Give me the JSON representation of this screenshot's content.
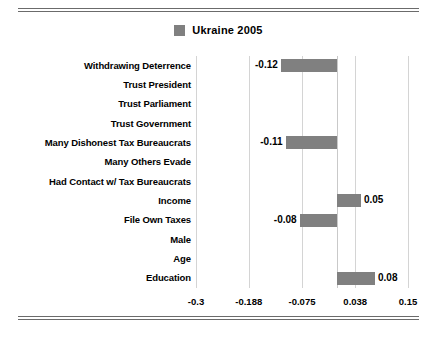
{
  "legend": {
    "swatch_color": "#808080",
    "label": "Ukraine 2005"
  },
  "axis": {
    "ticks": [
      "-0.3",
      "-0.188",
      "-0.075",
      "0.038",
      "0.15"
    ]
  },
  "chart_data": {
    "type": "bar",
    "orientation": "horizontal",
    "title": "",
    "subtitle": "",
    "xlabel": "",
    "ylabel": "",
    "xlim": [
      -0.3,
      0.15
    ],
    "xticks": [
      -0.3,
      -0.188,
      -0.075,
      0.038,
      0.15
    ],
    "xtick_labels": [
      "-0.3",
      "-0.188",
      "-0.075",
      "0.038",
      "0.15"
    ],
    "grid": true,
    "legend_position": "top-center",
    "bar_color": "#808080",
    "series": [
      {
        "name": "Ukraine 2005",
        "categories": [
          "Withdrawing Deterrence",
          "Trust President",
          "Trust Parliament",
          "Trust Government",
          "Many Dishonest Tax Bureaucrats",
          "Many Others Evade",
          "Had Contact w/ Tax Bureaucrats",
          "Income",
          "File Own Taxes",
          "Male",
          "Age",
          "Education"
        ],
        "values": [
          -0.12,
          null,
          null,
          null,
          -0.11,
          null,
          null,
          0.05,
          -0.08,
          null,
          null,
          0.08
        ],
        "value_labels": [
          "-0.12",
          "",
          "",
          "",
          "-0.11",
          "",
          "",
          "0.05",
          "-0.08",
          "",
          "",
          "0.08"
        ]
      }
    ]
  },
  "categories": [
    {
      "label": "Withdrawing Deterrence",
      "value": -0.12,
      "value_label": "-0.12"
    },
    {
      "label": "Trust President",
      "value": null,
      "value_label": ""
    },
    {
      "label": "Trust Parliament",
      "value": null,
      "value_label": ""
    },
    {
      "label": "Trust Government",
      "value": null,
      "value_label": ""
    },
    {
      "label": "Many Dishonest Tax Bureaucrats",
      "value": -0.11,
      "value_label": "-0.11"
    },
    {
      "label": "Many Others Evade",
      "value": null,
      "value_label": ""
    },
    {
      "label": "Had Contact w/ Tax Bureaucrats",
      "value": null,
      "value_label": ""
    },
    {
      "label": "Income",
      "value": 0.05,
      "value_label": "0.05"
    },
    {
      "label": "File Own Taxes",
      "value": -0.08,
      "value_label": "-0.08"
    },
    {
      "label": "Male",
      "value": null,
      "value_label": ""
    },
    {
      "label": "Age",
      "value": null,
      "value_label": ""
    },
    {
      "label": "Education",
      "value": 0.08,
      "value_label": "0.08"
    }
  ]
}
